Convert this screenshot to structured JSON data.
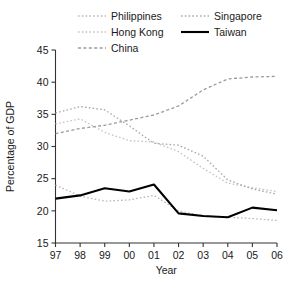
{
  "chart_data": {
    "type": "line",
    "title": "",
    "xlabel": "Year",
    "ylabel": "Percentage of GDP",
    "x": [
      "97",
      "98",
      "99",
      "00",
      "01",
      "02",
      "03",
      "04",
      "05",
      "06"
    ],
    "xlim": [
      0,
      9
    ],
    "ylim": [
      15,
      45
    ],
    "yticks": [
      15,
      20,
      25,
      30,
      35,
      40,
      45
    ],
    "grid": false,
    "legend_position": "top",
    "series": [
      {
        "name": "Philippines",
        "style": "dotted",
        "color": "#b9b9b9",
        "values": [
          24.0,
          22.3,
          21.5,
          21.7,
          22.4,
          20.0,
          19.2,
          19.0,
          18.8,
          18.5
        ]
      },
      {
        "name": "Hong Kong",
        "style": "dotted",
        "color": "#c4c4c4",
        "values": [
          33.5,
          34.3,
          32.2,
          30.9,
          30.7,
          29.2,
          26.6,
          24.3,
          23.6,
          23.0
        ]
      },
      {
        "name": "China",
        "style": "dashed",
        "color": "#9a9a9a",
        "values": [
          32.0,
          32.8,
          33.3,
          34.1,
          34.9,
          36.3,
          38.8,
          40.5,
          40.8,
          40.9
        ]
      },
      {
        "name": "Singapore",
        "style": "dotted",
        "color": "#a8a8a8",
        "values": [
          35.2,
          36.2,
          35.7,
          33.2,
          30.5,
          30.2,
          28.5,
          24.8,
          23.4,
          22.6
        ]
      },
      {
        "name": "Taiwan",
        "style": "solid",
        "color": "#000000",
        "values": [
          21.9,
          22.4,
          23.5,
          23.0,
          24.1,
          19.6,
          19.2,
          19.0,
          20.5,
          20.1
        ]
      }
    ]
  },
  "legend": {
    "columns": [
      {
        "entries": [
          {
            "label": "Philippines",
            "series": "Philippines"
          },
          {
            "label": "Hong Kong",
            "series": "Hong Kong"
          },
          {
            "label": "China",
            "series": "China"
          }
        ]
      },
      {
        "entries": [
          {
            "label": "Singapore",
            "series": "Singapore"
          },
          {
            "label": "Taiwan",
            "series": "Taiwan"
          }
        ]
      }
    ]
  }
}
